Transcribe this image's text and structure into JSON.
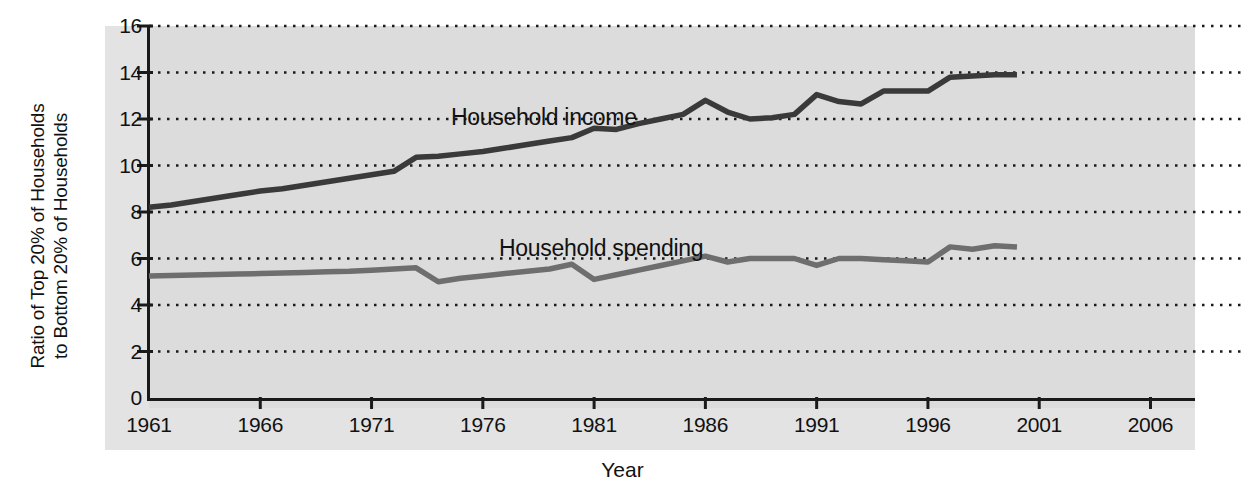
{
  "chart_data": {
    "type": "line",
    "title": "",
    "xlabel": "Year",
    "ylabel_line1": "Ratio of Top 20% of Households",
    "ylabel_line2": "to Bottom 20% of Households",
    "xlim": [
      1961,
      2008
    ],
    "ylim": [
      0,
      16
    ],
    "xticks": [
      1961,
      1966,
      1971,
      1976,
      1981,
      1986,
      1991,
      1996,
      2001,
      2006
    ],
    "yticks": [
      0,
      2,
      4,
      6,
      8,
      10,
      12,
      14,
      16
    ],
    "grid": "horizontal-dotted",
    "legend": "inline-annotations",
    "plot_bgcolor": "#dcdcdc",
    "band_color": "#e3e3e3",
    "axis_color": "#1a1a1a",
    "series": [
      {
        "name": "Household income",
        "color": "#3a3a3a",
        "label_x": 1978.0,
        "label_y": 12.8,
        "x": [
          1961,
          1962,
          1963,
          1964,
          1965,
          1966,
          1967,
          1968,
          1969,
          1970,
          1971,
          1972,
          1973,
          1974,
          1975,
          1976,
          1977,
          1978,
          1979,
          1980,
          1981,
          1982,
          1983,
          1984,
          1985,
          1986,
          1987,
          1988,
          1989,
          1990,
          1991,
          1992,
          1993,
          1994,
          1995,
          1996,
          1997,
          1998,
          1999,
          2000
        ],
        "values": [
          8.2,
          8.3,
          8.45,
          8.6,
          8.75,
          8.9,
          9.0,
          9.15,
          9.3,
          9.45,
          9.6,
          9.75,
          10.35,
          10.4,
          10.5,
          10.6,
          10.75,
          10.9,
          11.05,
          11.2,
          11.6,
          11.55,
          11.8,
          12.0,
          12.2,
          12.8,
          12.3,
          12.0,
          12.05,
          12.2,
          13.05,
          12.75,
          12.65,
          13.2,
          13.2,
          13.2,
          13.8,
          13.85,
          13.9,
          13.9
        ]
      },
      {
        "name": "Household spending",
        "color": "#6e6e6e",
        "label_x": 1980.5,
        "label_y": 7.05,
        "x": [
          1961,
          1962,
          1963,
          1964,
          1965,
          1966,
          1967,
          1968,
          1969,
          1970,
          1971,
          1972,
          1973,
          1974,
          1975,
          1976,
          1977,
          1978,
          1979,
          1980,
          1981,
          1982,
          1983,
          1984,
          1985,
          1986,
          1987,
          1988,
          1989,
          1990,
          1991,
          1992,
          1993,
          1994,
          1995,
          1996,
          1997,
          1998,
          1999,
          2000
        ],
        "values": [
          5.25,
          5.27,
          5.29,
          5.31,
          5.33,
          5.35,
          5.38,
          5.4,
          5.43,
          5.45,
          5.5,
          5.55,
          5.6,
          5.0,
          5.15,
          5.25,
          5.35,
          5.45,
          5.55,
          5.75,
          5.1,
          5.3,
          5.5,
          5.7,
          5.9,
          6.1,
          5.85,
          6.0,
          6.0,
          6.0,
          5.7,
          6.0,
          6.0,
          5.95,
          5.9,
          5.85,
          6.5,
          6.4,
          6.55,
          6.5
        ]
      }
    ]
  },
  "axis": {
    "yticks_text": [
      "16",
      "14",
      "12",
      "10",
      "8",
      "6",
      "4",
      "2",
      "0"
    ],
    "xticks_text": [
      "1961",
      "1966",
      "1971",
      "1976",
      "1981",
      "1986",
      "1991",
      "1996",
      "2001",
      "2006"
    ]
  },
  "labels": {
    "y_line1": "Ratio of Top 20% of Households",
    "y_line2": "to Bottom 20% of Households",
    "x_title": "Year",
    "series_income": "Household income",
    "series_spending": "Household spending"
  }
}
